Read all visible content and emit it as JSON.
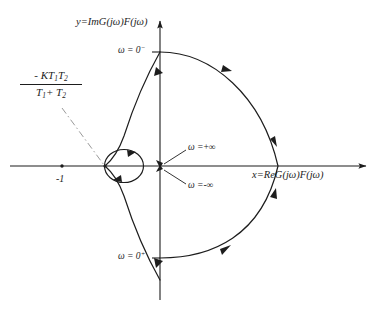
{
  "figure": {
    "type": "nyquist-plot",
    "background_color": "#ffffff",
    "ink_color": "#1d1d1d",
    "axes": {
      "x_axis_label": "x=ReG(jω)F(jω)",
      "y_axis_label": "y=ImG(jω)F(jω)",
      "origin_px": [
        160,
        166
      ],
      "x_axis_range_px": [
        10,
        370
      ],
      "y_axis_range_px": [
        18,
        300
      ]
    },
    "ticks": [
      {
        "name": "minus-one",
        "label": "-1",
        "x_px": 62,
        "y_px": 166
      }
    ],
    "annotations": {
      "omega_zero_minus": "ω = 0",
      "omega_zero_minus_sup": "−",
      "omega_zero_plus": "ω = 0",
      "omega_zero_plus_sup": "+",
      "omega_plus_infinity_lhs": "ω =",
      "omega_plus_infinity_rhs": "+∞",
      "omega_minus_infinity_lhs": "ω =",
      "omega_minus_infinity_rhs": "-∞",
      "crossing_point": {
        "numerator_prefix": "- KT",
        "numerator_sub1": "1",
        "numerator_mid": "T",
        "numerator_sub2": "2",
        "denominator_first": "T",
        "denominator_sub1": "1",
        "denominator_plus": "+ T",
        "denominator_sub2": "2"
      }
    },
    "curves": {
      "large_arc_right_crossing_x_px": 278,
      "small_circle_left_x_px": 105,
      "small_circle_right_x_px": 143,
      "omega_zero_minus_y_px": 52,
      "omega_zero_plus_y_px": 258
    }
  }
}
